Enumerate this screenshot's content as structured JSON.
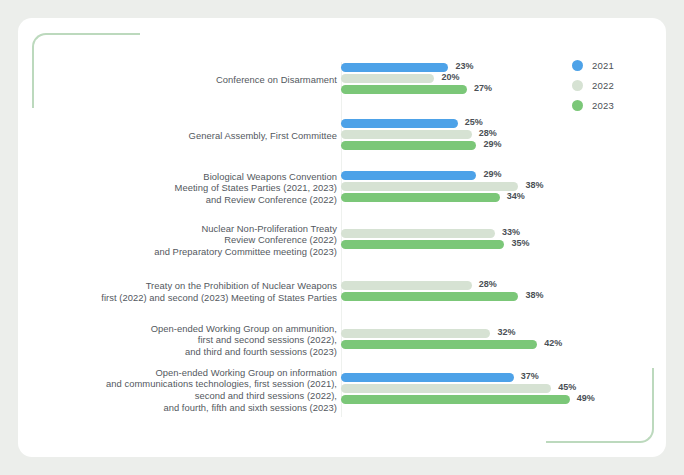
{
  "chart_data": {
    "type": "bar",
    "orientation": "horizontal",
    "title": "",
    "xlabel": "",
    "ylabel": "",
    "xlim": [
      0,
      52
    ],
    "grid": false,
    "value_suffix": "%",
    "legend_position": "top-right",
    "categories": [
      "Conference on Disarmament",
      "General Assembly, First Committee",
      "Biological Weapons Convention\nMeeting of States Parties (2021, 2023)\nand Review Conference (2022)",
      "Nuclear Non-Proliferation Treaty\nReview Conference (2022)\nand Preparatory Committee meeting (2023)",
      "Treaty on the Prohibition of Nuclear Weapons\nfirst (2022) and second (2023) Meeting of States Parties",
      "Open-ended Working Group on ammunition,\nfirst and second sessions (2022),\nand third and fourth sessions (2023)",
      "Open-ended Working Group on information\nand communications technologies, first session (2021),\nsecond and third sessions (2022),\nand fourth, fifth and sixth sessions (2023)"
    ],
    "series": [
      {
        "name": "2021",
        "color": "#4da2e8",
        "values": [
          23,
          25,
          29,
          null,
          null,
          null,
          37
        ]
      },
      {
        "name": "2022",
        "color": "#d6e2d3",
        "values": [
          20,
          28,
          38,
          33,
          28,
          32,
          45
        ]
      },
      {
        "name": "2023",
        "color": "#7bc778",
        "values": [
          27,
          29,
          34,
          35,
          38,
          42,
          49
        ]
      }
    ],
    "data_labels": [
      [
        "23%",
        "20%",
        "27%"
      ],
      [
        "25%",
        "28%",
        "29%"
      ],
      [
        "29%",
        "38%",
        "34%"
      ],
      [
        null,
        "33%",
        "35%"
      ],
      [
        null,
        "28%",
        "38%"
      ],
      [
        null,
        "32%",
        "42%"
      ],
      [
        "37%",
        "45%",
        "49%"
      ]
    ]
  },
  "legend": {
    "items": [
      {
        "label": "2021",
        "color": "#4da2e8"
      },
      {
        "label": "2022",
        "color": "#d6e2d3"
      },
      {
        "label": "2023",
        "color": "#7bc778"
      }
    ]
  },
  "theme": {
    "page_background": "#eceeeb",
    "card_background": "#ffffff",
    "bracket_color": "#bcd9bd",
    "text_color": "#53585e",
    "axis_color": "#eef1ee"
  }
}
